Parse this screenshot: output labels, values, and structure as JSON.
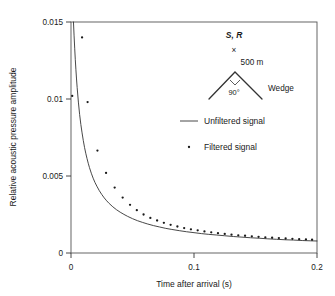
{
  "chart_data": {
    "type": "scatter",
    "title": "",
    "xlabel": "Time after arrival (s)",
    "ylabel": "Relative acoustic pressure amplitude",
    "xlim": [
      0,
      0.2
    ],
    "ylim": [
      0,
      0.015
    ],
    "xticks": [
      0,
      0.1,
      0.2
    ],
    "xtick_labels": [
      "0",
      "0.1",
      "0.2"
    ],
    "yticks": [
      0,
      0.005,
      0.01,
      0.015
    ],
    "ytick_labels": [
      "0",
      "0.005",
      "0.01",
      "0.015"
    ],
    "grid": false,
    "legend_position": "upper-right-inside",
    "series": [
      {
        "name": "Unfiltered signal",
        "type": "line",
        "marker": "none",
        "color": "#333333",
        "x": [
          0.002,
          0.0025,
          0.003,
          0.0035,
          0.004,
          0.0045,
          0.005,
          0.006,
          0.007,
          0.008,
          0.009,
          0.01,
          0.011,
          0.012,
          0.013,
          0.014,
          0.015,
          0.0165,
          0.018,
          0.0195,
          0.021,
          0.023,
          0.025,
          0.027,
          0.029,
          0.031,
          0.034,
          0.037,
          0.04,
          0.043,
          0.046,
          0.05,
          0.054,
          0.058,
          0.062,
          0.067,
          0.072,
          0.077,
          0.082,
          0.088,
          0.094,
          0.1,
          0.106,
          0.112,
          0.118,
          0.125,
          0.132,
          0.139,
          0.146,
          0.153,
          0.16,
          0.167,
          0.174,
          0.181,
          0.188,
          0.195,
          0.2
        ],
        "y": [
          0.015,
          0.0141,
          0.0133,
          0.01255,
          0.0119,
          0.0113,
          0.01075,
          0.0098,
          0.009,
          0.00835,
          0.0078,
          0.0073,
          0.00686,
          0.00648,
          0.00614,
          0.00583,
          0.00555,
          0.00518,
          0.00486,
          0.00458,
          0.00434,
          0.00405,
          0.0038,
          0.00358,
          0.00339,
          0.00322,
          0.003,
          0.00281,
          0.00265,
          0.00251,
          0.00238,
          0.00223,
          0.0021,
          0.00199,
          0.00189,
          0.00178,
          0.00169,
          0.0016,
          0.00153,
          0.00145,
          0.00138,
          0.00132,
          0.00126,
          0.00121,
          0.00117,
          0.00112,
          0.00107,
          0.00103,
          0.00099,
          0.00096,
          0.00092,
          0.00089,
          0.00086,
          0.00084,
          0.00081,
          0.00079,
          0.00078
        ]
      },
      {
        "name": "Filtered signal",
        "type": "scatter",
        "marker": "dot",
        "color": "#1a1a1a",
        "x": [
          0.001,
          0.009,
          0.0135,
          0.0215,
          0.0285,
          0.0355,
          0.042,
          0.048,
          0.0535,
          0.059,
          0.0645,
          0.07,
          0.0755,
          0.081,
          0.0865,
          0.092,
          0.0975,
          0.103,
          0.1085,
          0.114,
          0.1195,
          0.125,
          0.1305,
          0.136,
          0.1415,
          0.147,
          0.1525,
          0.158,
          0.1635,
          0.169,
          0.1745,
          0.18,
          0.1855,
          0.191,
          0.196
        ],
        "y": [
          0.0102,
          0.014,
          0.0098,
          0.00665,
          0.0052,
          0.00425,
          0.0036,
          0.00313,
          0.00278,
          0.0025,
          0.00228,
          0.00211,
          0.00196,
          0.00183,
          0.00172,
          0.00162,
          0.00154,
          0.00147,
          0.0014,
          0.00134,
          0.00129,
          0.00124,
          0.00119,
          0.00115,
          0.00112,
          0.00108,
          0.00105,
          0.00102,
          0.00099,
          0.00097,
          0.00094,
          0.00092,
          0.0009,
          0.00088,
          0.00086
        ]
      }
    ],
    "legend": [
      {
        "label": "Unfiltered signal",
        "marker": "line"
      },
      {
        "label": "Filtered signal",
        "marker": "dot"
      }
    ],
    "annotations": {
      "inset": {
        "source_receiver_label": "S, R",
        "source_marker": "×",
        "height_label": "500 m",
        "angle_label": "90°",
        "object_label": "Wedge"
      }
    }
  }
}
